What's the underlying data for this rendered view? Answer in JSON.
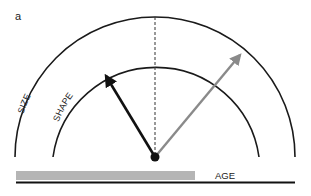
{
  "panel_label": "a",
  "labels": {
    "size": "SIZE",
    "shape": "SHAPE",
    "age": "AGE"
  },
  "colors": {
    "arc": "#1a1a1a",
    "black_arrow": "#111111",
    "gray_arrow": "#8a8a8a",
    "age_bar": "#b5b5b5",
    "baseline": "#111111",
    "dashed_line": "#333333"
  },
  "geometry": {
    "center": [
      155,
      157
    ],
    "outer_radius": 140,
    "inner_radius": 104,
    "black_arrow_tip": [
      105,
      73
    ],
    "gray_arrow_tip": [
      243,
      51
    ]
  }
}
